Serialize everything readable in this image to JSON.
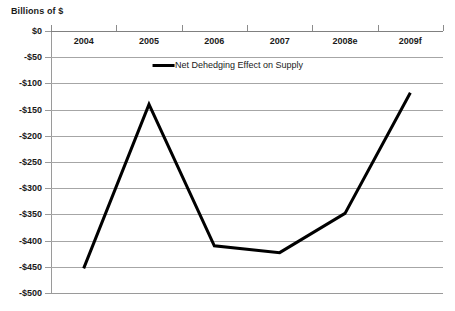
{
  "chart_data": {
    "type": "line",
    "title": "",
    "axis_title": "Billions of $",
    "xlabel": "",
    "ylabel": "Billions of $",
    "categories": [
      "2004",
      "2005",
      "2006",
      "2007",
      "2008e",
      "2009f"
    ],
    "series": [
      {
        "name": "Net Dehedging Effect on Supply",
        "color": "#000000",
        "values": [
          -453,
          -140,
          -410,
          -423,
          -348,
          -118
        ]
      }
    ],
    "ylim": [
      -500,
      0
    ],
    "ytick_values": [
      0,
      -50,
      -100,
      -150,
      -200,
      -250,
      -300,
      -350,
      -400,
      -450,
      -500
    ],
    "ytick_labels": [
      "$0",
      "-$50",
      "-$100",
      "-$150",
      "-$200",
      "-$250",
      "-$300",
      "-$350",
      "-$400",
      "-$450",
      "-$500"
    ],
    "grid": true,
    "legend_position": "top-center",
    "legend_entries": [
      "Net Dehedging Effect on Supply"
    ]
  },
  "legend": {
    "entry_label": "Net Dehedging Effect on Supply",
    "swatch_name": "line-swatch"
  },
  "axes": {
    "y_title": "Billions of $"
  }
}
